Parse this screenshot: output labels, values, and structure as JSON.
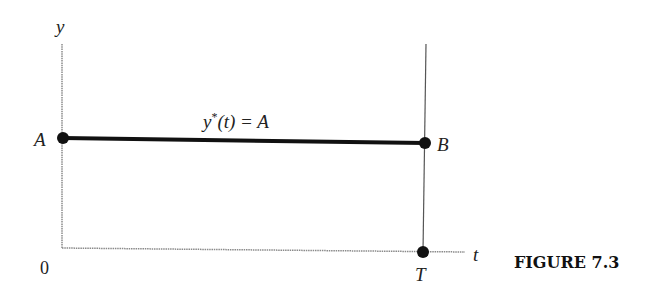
{
  "figure": {
    "caption": "FIGURE 7.3",
    "axes": {
      "y_label": "y",
      "x_label": "t",
      "origin_label": "0"
    },
    "points": {
      "start": "A",
      "end": "B",
      "terminal_time": "T"
    },
    "curve_label": {
      "func": "y",
      "star": "*",
      "arg": "(t) = A"
    }
  },
  "colors": {
    "path": "#111111",
    "axis": "#8a8a8a",
    "terminal_line": "#555555"
  }
}
